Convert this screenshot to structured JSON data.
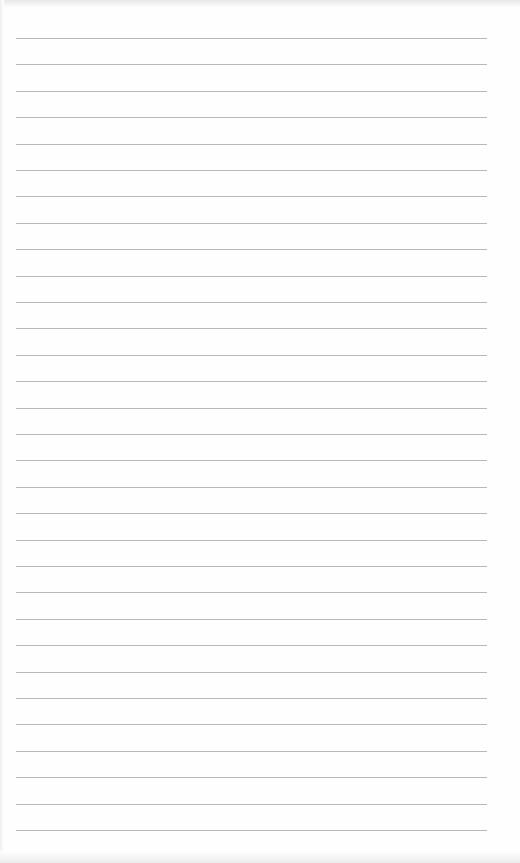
{
  "paper": {
    "type": "lined-paper",
    "line_count": 31,
    "first_line_y": 38,
    "line_spacing": 26.4,
    "line_left": 16,
    "line_width": 471,
    "line_color": "#b8b8b8",
    "background_color": "#fefefe"
  }
}
